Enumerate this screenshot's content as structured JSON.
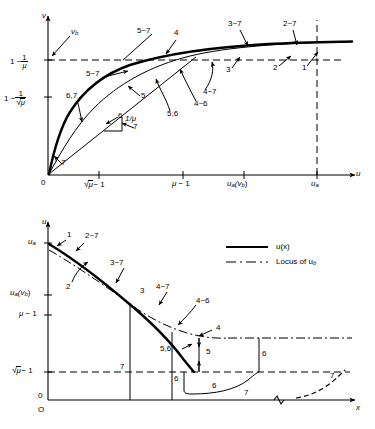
{
  "figure": {
    "type": "line",
    "title": "",
    "panels": [
      {
        "id": "top-panel",
        "xlabel": "u",
        "ylabel": "v",
        "origin_label": "0",
        "xticks": [
          "√μ − 1",
          "μ − 1",
          "uₐ(vᵇ)",
          "uₐ"
        ],
        "yticks": [
          "1 − 1/μ",
          "1 − 1/√μ"
        ],
        "curve_label": "v(u)",
        "slope_label": "1/μ",
        "vb_label": "vᵇ",
        "annotations": [
          "5~7",
          "4",
          "3~7",
          "2~7",
          "3",
          "2",
          "1",
          "5~7",
          "5",
          "5,6",
          "4~6",
          "4~7",
          "6,7",
          "6",
          "7",
          "7"
        ]
      },
      {
        "id": "bottom-panel",
        "xlabel": "x",
        "ylabel": "u",
        "origin_label": "O",
        "zero_label": "0",
        "yticks": [
          "uₐ",
          "uₐ(vᵇ)",
          "μ − 1",
          "√μ − 1"
        ],
        "annotations": [
          "1",
          "2~7",
          "2",
          "3~7",
          "3",
          "4~7",
          "4~6",
          "4",
          "5,6",
          "5",
          "6",
          "6",
          "6",
          "7",
          "7",
          "7"
        ]
      }
    ],
    "legend": {
      "position": "top-right-of-bottom-panel",
      "entries": [
        {
          "style": "solid",
          "label": "u(x)"
        },
        {
          "style": "dash-dot",
          "label": "Locus of uᵇ"
        }
      ]
    },
    "symbols": {
      "mu": "μ",
      "sqrt": "√",
      "minus": "−",
      "tilde": "~"
    },
    "colors": {
      "ink": "#000000",
      "background": "#ffffff"
    }
  },
  "labels": {
    "top": {
      "axis_v": "v",
      "axis_u": "u",
      "origin": "0",
      "vb": "v",
      "vb_sub": "b",
      "y1_lead": "1 −",
      "y1_num": "1",
      "y1_den": "μ",
      "y2_lead": "1 −",
      "y2_num": "1",
      "y2_den": "μ",
      "xt1_pre": "",
      "xt1_rad": "μ",
      "xt1_post": "− 1",
      "xt2": "μ − 1",
      "xt3_main": "u",
      "xt3_sub": "a",
      "xt3_paren_open": "(v",
      "xt3_sub2": "b",
      "xt3_paren_close": ")",
      "xt4_main": "u",
      "xt4_sub": "a",
      "slope_num": "1",
      "slope_den": "μ",
      "slope_text": "1/μ",
      "a_5to7_left": "5~7",
      "a_5to7_top": "5~7",
      "a_4": "4",
      "a_3to7": "3~7",
      "a_2to7": "2~7",
      "a_3": "3",
      "a_2": "2",
      "a_1": "1",
      "a_5": "5",
      "a_56": "5,6",
      "a_4to6": "4~6",
      "a_4to7": "4~7",
      "a_67": "6,7",
      "a_6": "6",
      "a_7a": "7",
      "a_7b": "7"
    },
    "bottom": {
      "axis_u": "u",
      "axis_x": "x",
      "origin": "O",
      "zero": "0",
      "yt_ua_main": "u",
      "yt_ua_sub": "a",
      "yt_uavb_main": "u",
      "yt_uavb_sub": "a",
      "yt_uavb_rest_open": "(v",
      "yt_uavb_sub2": "b",
      "yt_uavb_close": ")",
      "yt_mu": "μ − 1",
      "yt_sqrt_rad": "μ",
      "yt_sqrt_post": "− 1",
      "a_1": "1",
      "a_2to7": "2~7",
      "a_2": "2",
      "a_3to7": "3~7",
      "a_3": "3",
      "a_4to7": "4~7",
      "a_4to6": "4~6",
      "a_4": "4",
      "a_56": "5,6",
      "a_5": "5",
      "a_6a": "6",
      "a_6b": "6",
      "a_6c": "6",
      "a_7a": "7",
      "a_7b": "7",
      "a_7c": "7",
      "legend_solid": "u(x)",
      "legend_dashdot": "Locus of u",
      "legend_dashdot_sub": "b"
    }
  }
}
